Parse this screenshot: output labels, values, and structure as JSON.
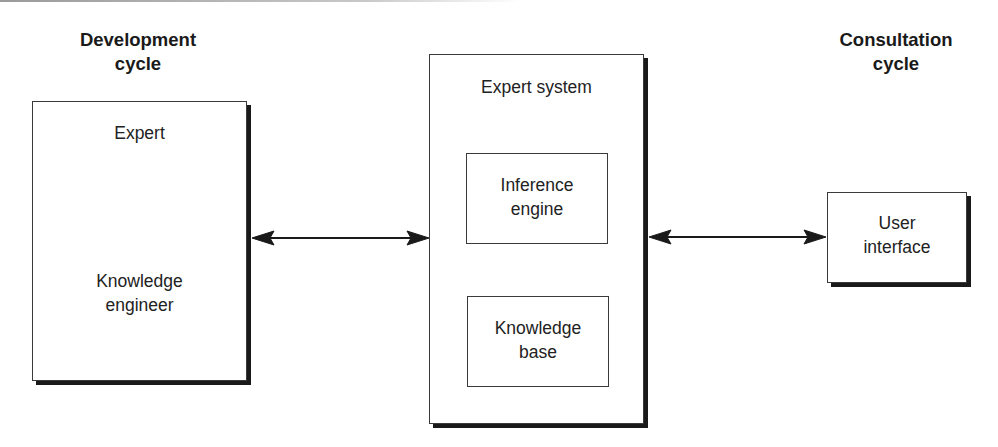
{
  "headings": {
    "development": [
      "Development",
      "cycle"
    ],
    "consultation": [
      "Consultation",
      "cycle"
    ]
  },
  "nodes": {
    "left_box": {
      "top_label": "Expert",
      "bottom_label": [
        "Knowledge",
        "engineer"
      ]
    },
    "expert_system": {
      "title": "Expert system",
      "inference_engine": [
        "Inference",
        "engine"
      ],
      "knowledge_base": [
        "Knowledge",
        "base"
      ]
    },
    "user_interface": [
      "User",
      "interface"
    ]
  },
  "edges": [
    {
      "from": "left_box",
      "to": "expert_system",
      "type": "bidirectional-arrow"
    },
    {
      "from": "expert_system",
      "to": "user_interface",
      "type": "bidirectional-arrow"
    }
  ],
  "colors": {
    "stroke": "#1a1a1a",
    "text": "#222222",
    "background": "#ffffff"
  }
}
